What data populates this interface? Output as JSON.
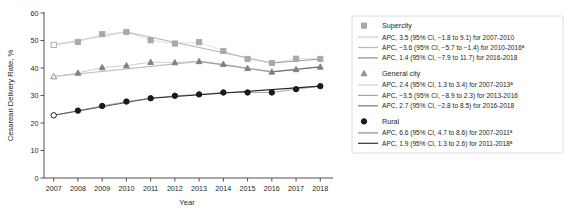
{
  "chart_data": {
    "type": "line",
    "title": "",
    "xlabel": "Year",
    "ylabel": "Cesarean Delivery Rate, %",
    "x": [
      2007,
      2008,
      2009,
      2010,
      2011,
      2012,
      2013,
      2014,
      2015,
      2016,
      2017,
      2018
    ],
    "xticklabels": [
      "2007",
      "2008",
      "2009",
      "2010",
      "2011",
      "2012",
      "2013",
      "2014",
      "2015",
      "2016",
      "2017",
      "2018"
    ],
    "yticklabels": [
      "0",
      "10",
      "20",
      "30",
      "40",
      "50",
      "60"
    ],
    "yticks": [
      0,
      10,
      20,
      30,
      40,
      50,
      60
    ],
    "ylim": [
      0,
      60
    ],
    "xlim": [
      2006.6,
      2018.4
    ],
    "grid": false,
    "legend_position": "right",
    "series": [
      {
        "name": "Supercity",
        "marker": "square",
        "color": "#a8a8a8",
        "first_point_open": true,
        "values": [
          48.4,
          49.5,
          52.3,
          53.1,
          50.1,
          48.9,
          49.4,
          46.2,
          43.3,
          41.8,
          43.4,
          43.3
        ]
      },
      {
        "name": "General city",
        "marker": "triangle",
        "color": "#808080",
        "first_point_open": true,
        "values": [
          36.9,
          38.2,
          40.2,
          40.9,
          42.1,
          42.0,
          42.4,
          41.4,
          39.9,
          38.6,
          39.5,
          40.4
        ]
      },
      {
        "name": "Rural",
        "marker": "circle",
        "color": "#1a1a1a",
        "first_point_open": true,
        "values": [
          22.8,
          24.5,
          26.2,
          27.8,
          29.0,
          29.9,
          30.4,
          31.1,
          31.1,
          31.1,
          32.3,
          33.4
        ]
      }
    ],
    "trend_segments": [
      {
        "series": "Supercity",
        "from": 2007,
        "to": 2010,
        "from_value": 48.4,
        "to_value": 53.1,
        "color": "#cfcfcf"
      },
      {
        "series": "Supercity",
        "from": 2010,
        "to": 2016,
        "from_value": 53.1,
        "to_value": 41.8,
        "color": "#b5b5b5"
      },
      {
        "series": "Supercity",
        "from": 2016,
        "to": 2018,
        "from_value": 41.8,
        "to_value": 43.3,
        "color": "#9a9a9a"
      },
      {
        "series": "General city",
        "from": 2007,
        "to": 2013,
        "from_value": 36.9,
        "to_value": 42.4,
        "color": "#bdbdbd"
      },
      {
        "series": "General city",
        "from": 2013,
        "to": 2016,
        "from_value": 42.4,
        "to_value": 38.6,
        "color": "#9c9c9c"
      },
      {
        "series": "General city",
        "from": 2016,
        "to": 2018,
        "from_value": 38.6,
        "to_value": 40.4,
        "color": "#6f6f6f"
      },
      {
        "series": "Rural",
        "from": 2007,
        "to": 2011,
        "from_value": 22.8,
        "to_value": 29.0,
        "color": "#5a5a5a"
      },
      {
        "series": "Rural",
        "from": 2011,
        "to": 2018,
        "from_value": 29.0,
        "to_value": 33.4,
        "color": "#262626"
      }
    ]
  },
  "axes": {
    "y_title": "Cesarean Delivery Rate, %",
    "x_title": "Year",
    "y_ticks": [
      "60",
      "50",
      "40",
      "30",
      "20",
      "10",
      "0"
    ],
    "x_ticks": [
      "2007",
      "2008",
      "2009",
      "2010",
      "2011",
      "2012",
      "2013",
      "2014",
      "2015",
      "2016",
      "2017",
      "2018"
    ]
  },
  "legend": {
    "groups": [
      {
        "marker": "square",
        "marker_color": "#a8a8a8",
        "heading": "Supercity",
        "entries": [
          {
            "swatch_color": "#cfcfcf",
            "text": "APC, 3.5 (95% CI, −1.8 to 9.1) for 2007-2010",
            "superscript": ""
          },
          {
            "swatch_color": "#b5b5b5",
            "text": "APC, −3.6 (95% CI, −5.7  to −1.4) for 2010-2016",
            "superscript": "a"
          },
          {
            "swatch_color": "#8c8c8c",
            "text": "APC, 1.4 (95% CI, −7.9 to 11.7) for 2016-2018",
            "superscript": ""
          }
        ]
      },
      {
        "marker": "triangle",
        "marker_color": "#909090",
        "heading": "General city",
        "entries": [
          {
            "swatch_color": "#d0d0d0",
            "text": "APC, 2.4 (95% CI, 1.3 to 3.4) for 2007-2013",
            "superscript": "a"
          },
          {
            "swatch_color": "#a6a6a6",
            "text": "APC, −3.5 (95% CI, −8.9  to 2.3) for 2013-2016",
            "superscript": ""
          },
          {
            "swatch_color": "#777777",
            "text": "APC, 2.7 (95% CI, −2.8 to 8.5) for 2016-2018",
            "superscript": ""
          }
        ]
      },
      {
        "marker": "circle",
        "marker_color": "#1a1a1a",
        "heading": "Rural",
        "entries": [
          {
            "swatch_color": "#8a8a8a",
            "text": "APC, 6.6 (95% CI, 4.7 to 8.6) for 2007-2011",
            "superscript": "a"
          },
          {
            "swatch_color": "#303030",
            "text": "APC, 1.9 (95% CI, 1.3  to 2.6) for 2011-2018",
            "superscript": "a"
          }
        ]
      }
    ]
  }
}
